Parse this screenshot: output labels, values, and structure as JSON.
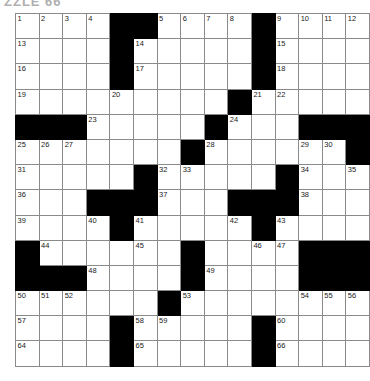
{
  "page": {
    "artifact_text": "ZZLE 66",
    "colors": {
      "block": "#000000",
      "cell": "#ffffff",
      "cell_border": "#8a8a8a",
      "grid_border": "#2b2b2b",
      "number_text": "#1a1a1a"
    }
  },
  "grid": {
    "rows": 14,
    "cols": 15,
    "cell_width": 22.6,
    "cell_height": 24.2,
    "legend": {
      "0": "open",
      "1": "block"
    },
    "cells": [
      [
        0,
        0,
        0,
        0,
        1,
        1,
        0,
        0,
        0,
        0,
        1,
        0,
        0,
        0,
        0
      ],
      [
        0,
        0,
        0,
        0,
        1,
        0,
        0,
        0,
        0,
        0,
        1,
        0,
        0,
        0,
        0
      ],
      [
        0,
        0,
        0,
        0,
        1,
        0,
        0,
        0,
        0,
        0,
        1,
        0,
        0,
        0,
        0
      ],
      [
        0,
        0,
        0,
        0,
        0,
        0,
        0,
        0,
        0,
        1,
        0,
        0,
        0,
        0,
        0
      ],
      [
        1,
        1,
        1,
        0,
        0,
        0,
        0,
        0,
        1,
        0,
        0,
        0,
        1,
        1,
        1
      ],
      [
        0,
        0,
        0,
        0,
        0,
        0,
        0,
        1,
        0,
        0,
        0,
        0,
        0,
        0,
        1
      ],
      [
        0,
        0,
        0,
        0,
        0,
        1,
        0,
        0,
        0,
        0,
        0,
        1,
        0,
        0,
        0
      ],
      [
        0,
        0,
        0,
        1,
        1,
        1,
        0,
        0,
        0,
        1,
        1,
        1,
        0,
        0,
        0
      ],
      [
        0,
        0,
        0,
        0,
        1,
        0,
        0,
        0,
        0,
        0,
        1,
        0,
        0,
        0,
        0
      ],
      [
        1,
        0,
        0,
        0,
        0,
        0,
        0,
        1,
        0,
        0,
        0,
        0,
        1,
        1,
        1
      ],
      [
        1,
        1,
        1,
        0,
        0,
        0,
        0,
        1,
        0,
        0,
        0,
        0,
        1,
        1,
        1
      ],
      [
        0,
        0,
        0,
        0,
        0,
        0,
        1,
        0,
        0,
        0,
        0,
        0,
        0,
        0,
        0
      ],
      [
        0,
        0,
        0,
        0,
        1,
        0,
        0,
        0,
        0,
        0,
        1,
        0,
        0,
        0,
        0
      ],
      [
        0,
        0,
        0,
        0,
        1,
        0,
        0,
        0,
        0,
        0,
        1,
        0,
        0,
        0,
        0
      ]
    ],
    "numbers": [
      [
        1,
        2,
        3,
        4,
        null,
        null,
        5,
        6,
        7,
        8,
        null,
        9,
        10,
        11,
        12
      ],
      [
        13,
        null,
        null,
        null,
        null,
        14,
        null,
        null,
        null,
        null,
        null,
        15,
        null,
        null,
        null
      ],
      [
        16,
        null,
        null,
        null,
        null,
        17,
        null,
        null,
        null,
        null,
        null,
        18,
        null,
        null,
        null
      ],
      [
        19,
        null,
        null,
        null,
        20,
        null,
        null,
        null,
        null,
        null,
        21,
        22,
        null,
        null,
        null
      ],
      [
        null,
        null,
        null,
        23,
        null,
        null,
        null,
        null,
        null,
        24,
        null,
        null,
        null,
        null,
        null
      ],
      [
        25,
        26,
        27,
        null,
        null,
        null,
        null,
        null,
        28,
        null,
        null,
        null,
        29,
        30,
        null
      ],
      [
        31,
        null,
        null,
        null,
        null,
        null,
        32,
        33,
        null,
        null,
        null,
        null,
        34,
        null,
        35
      ],
      [
        36,
        null,
        null,
        null,
        null,
        null,
        37,
        null,
        null,
        null,
        null,
        null,
        38,
        null,
        null
      ],
      [
        39,
        null,
        null,
        40,
        null,
        41,
        null,
        null,
        null,
        42,
        null,
        43,
        null,
        null,
        null
      ],
      [
        null,
        44,
        null,
        null,
        null,
        45,
        null,
        null,
        null,
        null,
        46,
        47,
        null,
        null,
        null
      ],
      [
        null,
        null,
        null,
        48,
        null,
        null,
        null,
        null,
        49,
        null,
        null,
        null,
        null,
        null,
        null
      ],
      [
        50,
        51,
        52,
        null,
        null,
        null,
        null,
        53,
        null,
        null,
        null,
        null,
        54,
        55,
        56
      ],
      [
        57,
        null,
        null,
        null,
        null,
        58,
        59,
        null,
        null,
        null,
        null,
        60,
        null,
        null,
        null
      ],
      [
        61,
        null,
        null,
        null,
        null,
        62,
        null,
        null,
        null,
        null,
        null,
        63,
        null,
        null,
        null
      ]
    ],
    "last_row_numbers": [
      64,
      null,
      null,
      null,
      null,
      65,
      null,
      null,
      null,
      null,
      null,
      66,
      null,
      null,
      null
    ]
  }
}
